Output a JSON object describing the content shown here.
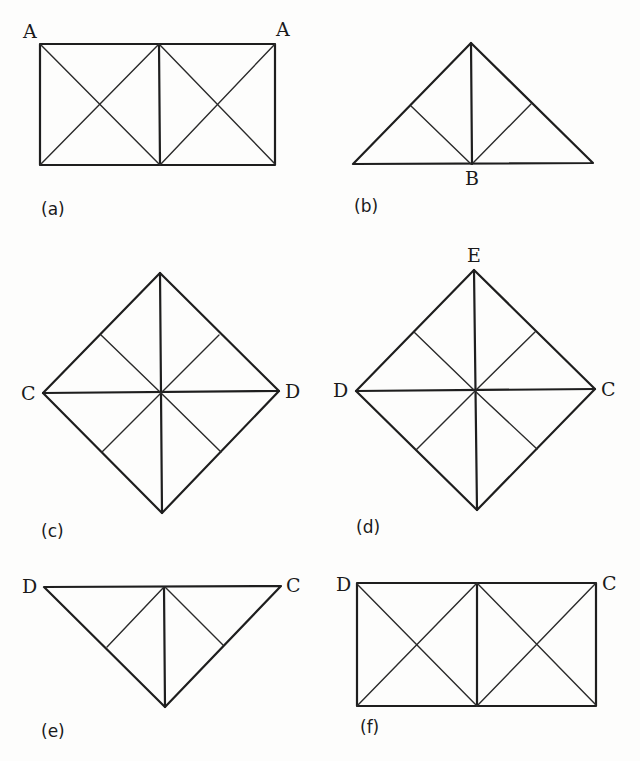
{
  "figure": {
    "panels": [
      {
        "id": "a",
        "caption": "(a)",
        "shape": "rectangle split into two squares, each with both diagonals",
        "vertex_labels": {
          "top_left": "A",
          "top_right": "A"
        }
      },
      {
        "id": "b",
        "caption": "(b)",
        "shape": "isosceles right triangle with altitude and two folds to base midpoint",
        "vertex_labels": {
          "base_mid": "B"
        }
      },
      {
        "id": "c",
        "caption": "(c)",
        "shape": "square rotated 45° with both diagonals and four half-folds",
        "vertex_labels": {
          "left": "C",
          "right": "D"
        }
      },
      {
        "id": "d",
        "caption": "(d)",
        "shape": "square rotated 45° with both diagonals and four half-folds",
        "vertex_labels": {
          "top": "E",
          "left": "D",
          "right": "C"
        }
      },
      {
        "id": "e",
        "caption": "(e)",
        "shape": "inverted isosceles right triangle with altitude and two folds",
        "vertex_labels": {
          "top_left": "D",
          "top_right": "C"
        }
      },
      {
        "id": "f",
        "caption": "(f)",
        "shape": "rectangle split into two squares, each with both diagonals",
        "vertex_labels": {
          "top_left": "D",
          "top_right": "C"
        }
      }
    ]
  },
  "colors": {
    "line": "#1e1e1e",
    "background": "#fdfdfc",
    "text": "#1a1a1a"
  }
}
